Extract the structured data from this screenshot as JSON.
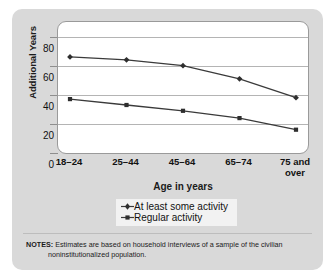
{
  "chart_data": {
    "type": "line",
    "title": "",
    "xlabel": "Age in years",
    "ylabel": "Additional Years",
    "categories": [
      "18–24",
      "25–44",
      "45–64",
      "65–74",
      "75 and over"
    ],
    "series": [
      {
        "name": "At least some activity",
        "marker": "diamond",
        "values": [
          66,
          64,
          60,
          51,
          38
        ]
      },
      {
        "name": "Regular activity",
        "marker": "square",
        "values": [
          37,
          33,
          29,
          24,
          16
        ]
      }
    ],
    "ylim": [
      0,
      90
    ],
    "yticks": [
      0,
      20,
      40,
      60,
      80
    ],
    "ytick_labels": [
      "0",
      "20",
      "40",
      "60",
      "80"
    ],
    "grid": "horizontal",
    "legend_position": "below-plot",
    "line_color": "#3a3a3a"
  },
  "notes": {
    "label": "NOTES:",
    "line1": "Estimates are based on household interviews of a sample of the civilian",
    "line2": "noninstitutionalized population."
  },
  "colors": {
    "panel_background": "#d9d9d9",
    "plot_background": "#ffffff",
    "gridline": "#b4b4b4",
    "text": "#111111",
    "series_line": "#3a3a3a"
  }
}
